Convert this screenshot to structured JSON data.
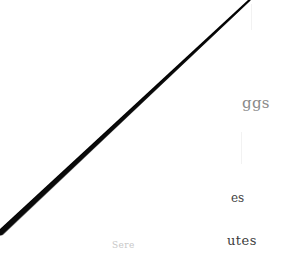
{
  "document": {
    "fragments": [
      {
        "id": "eggs",
        "text": "ggs"
      },
      {
        "id": "es",
        "text": "es"
      },
      {
        "id": "utes",
        "text": "utes"
      },
      {
        "id": "faint",
        "text": "Sere"
      }
    ]
  },
  "annotation": {
    "type": "diagonal-strikethrough",
    "color": "#000000"
  }
}
